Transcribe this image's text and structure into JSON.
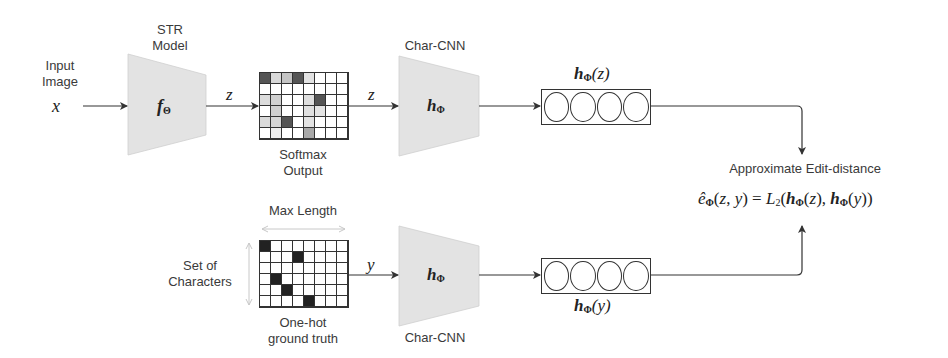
{
  "input": {
    "label_line1": "Input",
    "label_line2": "Image",
    "symbol": "x"
  },
  "str_model": {
    "title_line1": "STR",
    "title_line2": "Model",
    "symbol": "f",
    "symbol_sub": "Θ"
  },
  "edge_z1": "z",
  "edge_z2": "z",
  "edge_y": "y",
  "softmax": {
    "label_line1": "Softmax",
    "label_line2": "Output",
    "rows": 6,
    "cols": 8,
    "cells": [
      [
        "#555",
        "#d8d8d8",
        "#c4c4c4",
        "#555",
        "#e2e2e2",
        "#fff",
        "#fff",
        "#fff"
      ],
      [
        "#fff",
        "#fff",
        "#fff",
        "#fff",
        "#fff",
        "#fff",
        "#fff",
        "#fff"
      ],
      [
        "#dcdcdc",
        "#d0d0d0",
        "#fff",
        "#fff",
        "#dedede",
        "#555",
        "#fff",
        "#fff"
      ],
      [
        "#fff",
        "#cfcfcf",
        "#fff",
        "#fff",
        "#e0e0e0",
        "#e4e4e4",
        "#fff",
        "#fff"
      ],
      [
        "#dadada",
        "#d6d6d6",
        "#555",
        "#fff",
        "#e2e2e2",
        "#fff",
        "#fff",
        "#fff"
      ],
      [
        "#fff",
        "#eeeeee",
        "#fff",
        "#fff",
        "#a8a8a8",
        "#fff",
        "#fff",
        "#fff"
      ]
    ]
  },
  "char_cnn_top": {
    "title": "Char-CNN",
    "symbol": "h",
    "symbol_sub": "Φ"
  },
  "char_cnn_bottom": {
    "title": "Char-CNN",
    "symbol": "h",
    "symbol_sub": "Φ"
  },
  "embedding_z": {
    "label": "h",
    "label_sub": "Φ",
    "label_arg": "(z)",
    "circles": 4
  },
  "embedding_y": {
    "label": "h",
    "label_sub": "Φ",
    "label_arg": "(y)",
    "circles": 4
  },
  "onehot": {
    "max_length_label": "Max Length",
    "set_label_line1": "Set of",
    "set_label_line2": "Characters",
    "label_line1": "One-hot",
    "label_line2": "ground truth",
    "rows": 6,
    "cols": 8,
    "hot": [
      [
        0,
        0
      ],
      [
        1,
        3
      ],
      [
        3,
        1
      ],
      [
        4,
        2
      ],
      [
        5,
        4
      ]
    ]
  },
  "output": {
    "title": "Approximate Edit-distance",
    "formula": "ê_Φ(z, y) = L_2(h_Φ(z), h_Φ(y))"
  },
  "colors": {
    "block_fill": "#e3e3e3",
    "line": "#333333",
    "dark_cell": "#555555"
  }
}
